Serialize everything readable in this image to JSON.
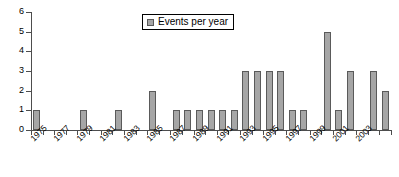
{
  "chart_data": {
    "type": "bar",
    "title": "",
    "xlabel": "",
    "ylabel": "",
    "ylim": [
      0,
      6
    ],
    "ytick_labels": [
      "0",
      "1",
      "2",
      "3",
      "4",
      "5",
      "6"
    ],
    "ytick_values": [
      0,
      1,
      2,
      3,
      4,
      5,
      6
    ],
    "grid": false,
    "legend_position": "top-center",
    "legend": [
      "Events per year"
    ],
    "series_name": "Events per year",
    "bar_color": "#a6a6a6",
    "bar_border_color": "#5a5a5a",
    "axis_color": "#4d4d4d",
    "categories": [
      "1975",
      "1976",
      "1977",
      "1978",
      "1979",
      "1980",
      "1981",
      "1982",
      "1983",
      "1984",
      "1985",
      "1986",
      "1987",
      "1988",
      "1989",
      "1990",
      "1991",
      "1992",
      "1993",
      "1994",
      "1995",
      "1996",
      "1997",
      "1998",
      "1999",
      "2000",
      "2001",
      "2002",
      "2003",
      "2004",
      "2005"
    ],
    "values": [
      1,
      0,
      0,
      0,
      1,
      0,
      0,
      1,
      0,
      0,
      2,
      0,
      1,
      1,
      1,
      1,
      1,
      1,
      3,
      3,
      3,
      3,
      1,
      1,
      0,
      5,
      1,
      3,
      0,
      3,
      2
    ],
    "xtick_labels_shown": [
      "1975",
      "1977",
      "1979",
      "1981",
      "1983",
      "1985",
      "1987",
      "1989",
      "1991",
      "1993",
      "1995",
      "1997",
      "1999",
      "2001",
      "2003"
    ]
  }
}
